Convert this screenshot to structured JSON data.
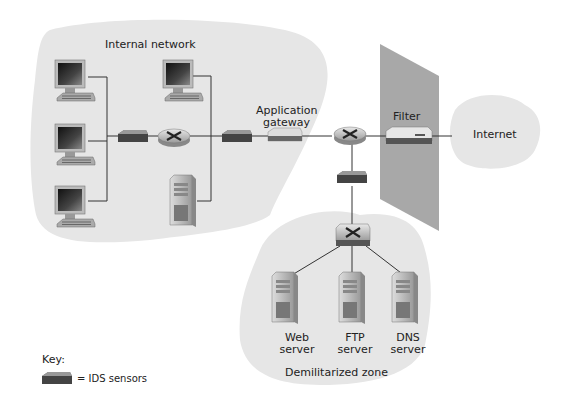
{
  "labels": {
    "internal_network": "Internal network",
    "app_gateway_line1": "Application",
    "app_gateway_line2": "gateway",
    "filter": "Filter",
    "internet": "Internet",
    "web_line1": "Web",
    "web_line2": "server",
    "ftp_line1": "FTP",
    "ftp_line2": "server",
    "dns_line1": "DNS",
    "dns_line2": "server",
    "dmz": "Demilitarized zone",
    "key_title": "Key:",
    "key_ids": "= IDS sensors"
  },
  "colors": {
    "cloud": "#e6e6e6",
    "filter_wall": "#a8a8a8",
    "line": "#333333",
    "device_dark": "#555555"
  }
}
